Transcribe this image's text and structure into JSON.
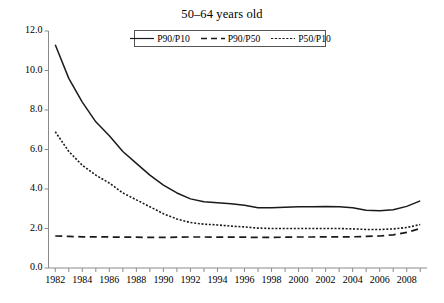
{
  "chart_data": {
    "type": "line",
    "title": "50–64 years old",
    "xlabel": "",
    "ylabel": "",
    "xlim": [
      1981.5,
      2009.5
    ],
    "ylim": [
      0.0,
      12.0
    ],
    "yticks": [
      "0.0",
      "2.0",
      "4.0",
      "6.0",
      "8.0",
      "10.0",
      "12.0"
    ],
    "ytick_values": [
      0.0,
      2.0,
      4.0,
      6.0,
      8.0,
      10.0,
      12.0
    ],
    "x": [
      1982,
      1983,
      1984,
      1985,
      1986,
      1987,
      1988,
      1989,
      1990,
      1991,
      1992,
      1993,
      1994,
      1995,
      1996,
      1997,
      1998,
      1999,
      2000,
      2001,
      2002,
      2003,
      2004,
      2005,
      2006,
      2007,
      2008,
      2009
    ],
    "xtick_labels": [
      "1982",
      "1984",
      "1986",
      "1988",
      "1990",
      "1992",
      "1994",
      "1996",
      "1998",
      "2000",
      "2002",
      "2004",
      "2006",
      "2008"
    ],
    "xtick_label_values": [
      1982,
      1984,
      1986,
      1988,
      1990,
      1992,
      1994,
      1996,
      1998,
      2000,
      2002,
      2004,
      2006,
      2008
    ],
    "grid": false,
    "legend_position": "top-center",
    "series": [
      {
        "name": "P90/P10",
        "style": "solid",
        "color": "#1a1a1a",
        "values": [
          11.3,
          9.6,
          8.4,
          7.4,
          6.7,
          5.9,
          5.3,
          4.7,
          4.2,
          3.8,
          3.5,
          3.35,
          3.3,
          3.25,
          3.18,
          3.05,
          3.05,
          3.08,
          3.1,
          3.1,
          3.12,
          3.1,
          3.05,
          2.92,
          2.9,
          2.95,
          3.12,
          3.4
        ]
      },
      {
        "name": "P90/P50",
        "style": "dashed",
        "color": "#1a1a1a",
        "values": [
          1.62,
          1.6,
          1.58,
          1.58,
          1.57,
          1.56,
          1.56,
          1.55,
          1.55,
          1.56,
          1.57,
          1.57,
          1.56,
          1.56,
          1.56,
          1.55,
          1.55,
          1.56,
          1.57,
          1.57,
          1.58,
          1.58,
          1.58,
          1.6,
          1.62,
          1.68,
          1.8,
          2.0
        ]
      },
      {
        "name": "P50/P10",
        "style": "dotted",
        "color": "#1a1a1a",
        "values": [
          6.9,
          5.9,
          5.2,
          4.7,
          4.3,
          3.8,
          3.45,
          3.1,
          2.75,
          2.48,
          2.3,
          2.22,
          2.18,
          2.12,
          2.08,
          2.02,
          2.0,
          2.0,
          2.0,
          2.0,
          2.0,
          2.0,
          1.98,
          1.95,
          1.95,
          1.98,
          2.05,
          2.2
        ]
      }
    ]
  },
  "legend": {
    "items": [
      {
        "label": "P90/P10"
      },
      {
        "label": "P90/P50"
      },
      {
        "label": "P50/P10"
      }
    ]
  }
}
